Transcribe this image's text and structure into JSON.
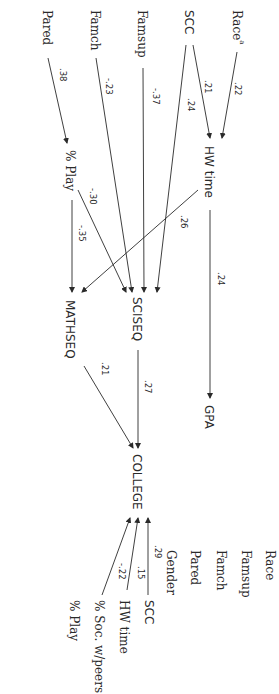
{
  "diagram": {
    "orientation": "rotated-90-clockwise",
    "exogenous": {
      "race": "Race",
      "race_sup": "a",
      "scc": "SCC",
      "famsup": "Famsup",
      "famch": "Famch",
      "pared": "Pared"
    },
    "mediators": {
      "hw_time": "HW time",
      "pct_play": "% Play"
    },
    "outcomes": {
      "gpa": "GPA",
      "sciseq": "SCISEQ",
      "mathseq": "MATHSEQ",
      "college": "COLLEGE"
    },
    "right_list": {
      "race": "Race",
      "famsup": "Famsup",
      "famch": "Famch",
      "pared": "Pared",
      "gender": "Gender",
      "scc": "SCC",
      "hw_time": "HW time",
      "pct_soc": "% Soc. w/peers",
      "pct_play": "% Play"
    },
    "paths": [
      {
        "from": "Race",
        "to": "HW time",
        "coef": ".22"
      },
      {
        "from": "SCC",
        "to": "HW time",
        "coef": ".21"
      },
      {
        "from": "SCC",
        "to": "SCISEQ",
        "coef": ".24"
      },
      {
        "from": "Famsup",
        "to": "SCISEQ",
        "coef": "-.37"
      },
      {
        "from": "Famch",
        "to": "SCISEQ",
        "coef": "-.23"
      },
      {
        "from": "Pared",
        "to": "% Play",
        "coef": ".38"
      },
      {
        "from": "% Play",
        "to": "SCISEQ",
        "coef": "-.30"
      },
      {
        "from": "% Play",
        "to": "MATHSEQ",
        "coef": "-.35"
      },
      {
        "from": "HW time",
        "to": "MATHSEQ",
        "coef": ".26"
      },
      {
        "from": "HW time",
        "to": "GPA",
        "coef": ".24"
      },
      {
        "from": "SCISEQ",
        "to": "COLLEGE",
        "coef": ".27"
      },
      {
        "from": "MATHSEQ",
        "to": "COLLEGE",
        "coef": ".21"
      },
      {
        "from": "SCC",
        "to": "COLLEGE",
        "coef": ".29"
      },
      {
        "from": "HW time",
        "to": "COLLEGE",
        "coef": ".15"
      },
      {
        "from": "% Soc. w/peers",
        "to": "COLLEGE",
        "coef": "-.22"
      }
    ],
    "coefs": {
      "race_hw": ".22",
      "scc_hw": ".21",
      "scc_sciseq": ".24",
      "famsup_sciseq": "-.37",
      "famch_sciseq": "-.23",
      "pared_play": ".38",
      "play_sciseq": "-.30",
      "play_mathseq": "-.35",
      "hw_mathseq": ".26",
      "hw_gpa": ".24",
      "sciseq_college": ".27",
      "mathseq_college": ".21",
      "scc_college": ".29",
      "hw_college": ".15",
      "soc_college": "-.22"
    },
    "colors": {
      "line": "#2a2a2a",
      "text": "#2a2a2a",
      "background": "#ffffff"
    }
  }
}
